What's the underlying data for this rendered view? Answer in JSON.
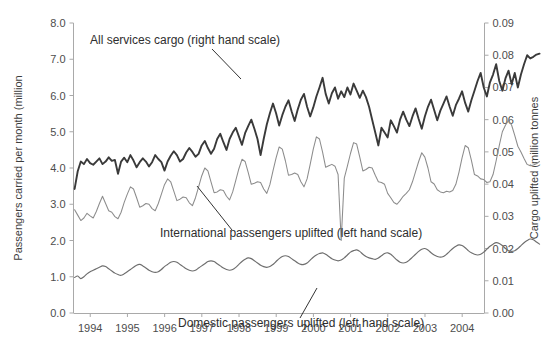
{
  "chart_data": {
    "type": "line",
    "title": "",
    "subtitle": "",
    "xlabel": "",
    "ylabel": "Passengers carried per month (million",
    "y2label": "Cargo uplifted (million tonnes",
    "grid": false,
    "legend_position": "inline-annotations",
    "x_tick_labels": [
      "1994",
      "1995",
      "1996",
      "1997",
      "1998",
      "1999",
      "2000",
      "2001",
      "2002",
      "2003",
      "2004"
    ],
    "x_tick_values": [
      1994,
      1995,
      1996,
      1997,
      1998,
      1999,
      2000,
      2001,
      2002,
      2003,
      2004
    ],
    "xlim": [
      1993.55,
      2004.6
    ],
    "ylim": [
      0.0,
      8.0
    ],
    "y_tick_labels": [
      "0.0",
      "1.0",
      "2.0",
      "3.0",
      "4.0",
      "5.0",
      "6.0",
      "7.0",
      "8.0"
    ],
    "y_tick_values": [
      0.0,
      1.0,
      2.0,
      3.0,
      4.0,
      5.0,
      6.0,
      7.0,
      8.0
    ],
    "y2lim": [
      0.0,
      0.09
    ],
    "y2_tick_labels": [
      "0.00",
      "0.01",
      "0.02",
      "0.03",
      "0.04",
      "0.05",
      "0.06",
      "0.07",
      "0.08",
      "0.09"
    ],
    "y2_tick_values": [
      0.0,
      0.01,
      0.02,
      0.03,
      0.04,
      0.05,
      0.06,
      0.07,
      0.08,
      0.09
    ],
    "annotations": [
      {
        "name": "cargo-annotation",
        "text": "All services cargo (right hand scale)",
        "points_to": "All services cargo series"
      },
      {
        "name": "international-annotation",
        "text": "International passengers uplifted (left hand scale)",
        "points_to": "International passengers series"
      },
      {
        "name": "domestic-annotation",
        "text": "Domestic passengers uplifted (left  hand scale)",
        "points_to": "Domestic passengers series"
      }
    ],
    "series": [
      {
        "name": "All services cargo (right hand scale)",
        "axis": "right",
        "unit": "million tonnes",
        "color": "#3a3a3a",
        "x_start": 1993.58,
        "x_step": 0.0833333,
        "values": [
          0.0385,
          0.044,
          0.047,
          0.0462,
          0.0478,
          0.0465,
          0.046,
          0.047,
          0.048,
          0.0462,
          0.047,
          0.0483,
          0.0472,
          0.0475,
          0.0432,
          0.047,
          0.0482,
          0.0468,
          0.049,
          0.0473,
          0.0452,
          0.0468,
          0.048,
          0.047,
          0.0455,
          0.0468,
          0.049,
          0.0478,
          0.0468,
          0.0442,
          0.047,
          0.0488,
          0.0502,
          0.049,
          0.047,
          0.0478,
          0.0498,
          0.0512,
          0.05,
          0.0485,
          0.0494,
          0.052,
          0.0534,
          0.0512,
          0.0494,
          0.051,
          0.054,
          0.0556,
          0.053,
          0.0506,
          0.054,
          0.056,
          0.0575,
          0.0548,
          0.0522,
          0.0558,
          0.058,
          0.06,
          0.0572,
          0.054,
          0.049,
          0.054,
          0.0585,
          0.062,
          0.065,
          0.062,
          0.0582,
          0.0614,
          0.064,
          0.066,
          0.0626,
          0.0596,
          0.0632,
          0.0662,
          0.068,
          0.064,
          0.061,
          0.0638,
          0.0672,
          0.07,
          0.073,
          0.068,
          0.065,
          0.0682,
          0.07,
          0.0665,
          0.0688,
          0.067,
          0.07,
          0.0678,
          0.0712,
          0.069,
          0.0668,
          0.069,
          0.067,
          0.064,
          0.06,
          0.056,
          0.052,
          0.0575,
          0.056,
          0.0545,
          0.0598,
          0.058,
          0.056,
          0.06,
          0.0625,
          0.06,
          0.058,
          0.061,
          0.0635,
          0.0602,
          0.0572,
          0.061,
          0.064,
          0.0662,
          0.063,
          0.0598,
          0.0628,
          0.065,
          0.0672,
          0.064,
          0.0612,
          0.0645,
          0.0665,
          0.0688,
          0.0652,
          0.0625,
          0.066,
          0.069,
          0.072,
          0.0745,
          0.07,
          0.0672,
          0.0716,
          0.074,
          0.0772,
          0.072,
          0.069,
          0.0728,
          0.0752,
          0.071,
          0.0745,
          0.07,
          0.074,
          0.0772,
          0.08,
          0.079,
          0.0795,
          0.0802,
          0.0805
        ]
      },
      {
        "name": "International passengers uplifted (left hand scale)",
        "axis": "left",
        "unit": "million",
        "color": "#8c8c8c",
        "x_start": 1993.58,
        "x_step": 0.0833333,
        "values": [
          2.85,
          2.7,
          2.55,
          2.62,
          2.75,
          2.68,
          2.62,
          2.8,
          3.02,
          3.22,
          3.02,
          2.82,
          2.78,
          2.66,
          2.6,
          2.78,
          3.05,
          3.28,
          3.48,
          3.42,
          3.18,
          2.92,
          2.96,
          3.02,
          3.0,
          2.88,
          2.82,
          3.02,
          3.28,
          3.54,
          3.7,
          3.62,
          3.36,
          3.1,
          3.14,
          3.2,
          3.18,
          3.04,
          2.96,
          3.18,
          3.48,
          3.78,
          4.0,
          3.92,
          3.62,
          3.32,
          3.34,
          3.4,
          3.38,
          3.22,
          3.12,
          3.34,
          3.66,
          3.98,
          4.24,
          4.18,
          3.88,
          3.55,
          3.58,
          3.62,
          3.6,
          3.42,
          3.3,
          3.54,
          3.92,
          4.28,
          4.58,
          4.52,
          4.2,
          3.8,
          3.82,
          3.86,
          3.82,
          3.62,
          3.48,
          3.7,
          4.1,
          4.52,
          4.86,
          4.8,
          4.44,
          4.02,
          4.06,
          4.1,
          4.05,
          3.82,
          2.0,
          3.72,
          4.05,
          4.4,
          4.7,
          4.66,
          4.3,
          3.92,
          3.96,
          4.02,
          4.0,
          3.8,
          3.62,
          3.6,
          3.55,
          3.3,
          3.18,
          3.05,
          3.0,
          3.1,
          3.22,
          3.3,
          3.4,
          3.62,
          3.9,
          4.18,
          4.42,
          4.3,
          4.0,
          3.62,
          3.56,
          3.4,
          3.34,
          3.32,
          3.36,
          3.34,
          3.38,
          3.55,
          3.88,
          4.28,
          4.62,
          4.56,
          4.22,
          3.82,
          3.78,
          3.7,
          3.68,
          3.6,
          3.62,
          3.82,
          4.2,
          4.62,
          5.0,
          5.18,
          5.32,
          5.18,
          4.9,
          4.6,
          4.44,
          4.26,
          4.1,
          4.06,
          4.08,
          4.12,
          4.18
        ]
      },
      {
        "name": "Domestic passengers uplifted (left  hand scale)",
        "axis": "left",
        "unit": "million",
        "color": "#6e6e6e",
        "x_start": 1993.58,
        "x_step": 0.0833333,
        "values": [
          0.98,
          1.02,
          0.95,
          1.0,
          1.08,
          1.14,
          1.18,
          1.22,
          1.26,
          1.3,
          1.28,
          1.22,
          1.16,
          1.1,
          1.06,
          1.04,
          1.08,
          1.14,
          1.2,
          1.26,
          1.32,
          1.34,
          1.3,
          1.24,
          1.18,
          1.14,
          1.12,
          1.14,
          1.2,
          1.28,
          1.34,
          1.4,
          1.42,
          1.4,
          1.34,
          1.28,
          1.22,
          1.18,
          1.16,
          1.18,
          1.24,
          1.3,
          1.36,
          1.42,
          1.44,
          1.42,
          1.36,
          1.3,
          1.24,
          1.2,
          1.18,
          1.2,
          1.26,
          1.34,
          1.42,
          1.48,
          1.52,
          1.5,
          1.44,
          1.38,
          1.32,
          1.28,
          1.26,
          1.28,
          1.34,
          1.42,
          1.5,
          1.56,
          1.58,
          1.56,
          1.5,
          1.44,
          1.38,
          1.34,
          1.34,
          1.38,
          1.46,
          1.54,
          1.6,
          1.64,
          1.66,
          1.62,
          1.56,
          1.5,
          1.46,
          1.44,
          1.46,
          1.52,
          1.6,
          1.68,
          1.72,
          1.74,
          1.7,
          1.62,
          1.56,
          1.52,
          1.5,
          1.48,
          1.52,
          1.58,
          1.64,
          1.66,
          1.62,
          1.54,
          1.46,
          1.4,
          1.38,
          1.4,
          1.46,
          1.54,
          1.62,
          1.7,
          1.76,
          1.78,
          1.74,
          1.66,
          1.6,
          1.56,
          1.54,
          1.56,
          1.62,
          1.7,
          1.78,
          1.84,
          1.88,
          1.86,
          1.8,
          1.72,
          1.66,
          1.62,
          1.6,
          1.62,
          1.68,
          1.76,
          1.84,
          1.9,
          1.94,
          1.92,
          1.86,
          1.78,
          1.72,
          1.7,
          1.72,
          1.78,
          1.86,
          1.94,
          2.0,
          2.04,
          2.02,
          1.96,
          1.9
        ]
      }
    ]
  },
  "axes": {
    "left_title": "Passengers carried per month (million",
    "right_title": "Cargo uplifted (million tonnes"
  },
  "annotations": {
    "cargo": "All services cargo (right hand scale)",
    "international": "International passengers uplifted (left hand scale)",
    "domestic": "Domestic passengers uplifted (left  hand scale)"
  },
  "colors": {
    "cargo": "#3a3a3a",
    "international": "#8c8c8c",
    "domestic": "#6e6e6e",
    "axis": "#a9a9a9",
    "text": "#3d3d3d",
    "background": "#ffffff"
  }
}
